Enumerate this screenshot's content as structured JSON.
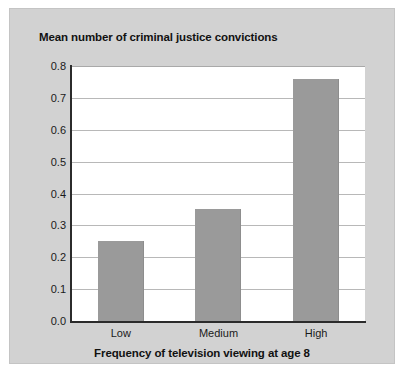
{
  "chart_data": {
    "type": "bar",
    "title": "Mean number of criminal justice convictions",
    "xlabel": "Frequency of television viewing at age 8",
    "ylabel": "",
    "categories": [
      "Low",
      "Medium",
      "High"
    ],
    "values": [
      0.25,
      0.35,
      0.76
    ],
    "ylim": [
      0.0,
      0.8
    ],
    "ytick_labels": [
      "0.0",
      "0.1",
      "0.2",
      "0.3",
      "0.4",
      "0.5",
      "0.6",
      "0.7",
      "0.8"
    ],
    "ytick_values": [
      0.0,
      0.1,
      0.2,
      0.3,
      0.4,
      0.5,
      0.6,
      0.7,
      0.8
    ],
    "grid": true,
    "legend": "none",
    "series": [
      {
        "name": "Mean number of criminal justice convictions",
        "values": [
          0.25,
          0.35,
          0.76
        ]
      }
    ],
    "colors": {
      "bar_fill": "#9a9a9a",
      "plot_background": "#ffffff",
      "card_background": "#d2d2d2",
      "axis_line": "#2b2b2b",
      "gridline": "#b8b8b8",
      "text": "#111111"
    }
  }
}
